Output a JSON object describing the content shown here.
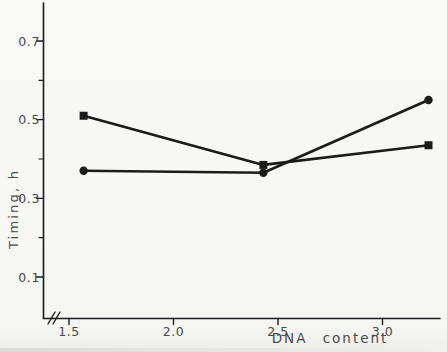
{
  "figure": {
    "background": "#f7f7f4",
    "ink": "#1b1b1b",
    "label_color": "#4a4a48"
  },
  "chart_data": {
    "type": "line",
    "title": "",
    "xlabel": "DNA content",
    "ylabel": "Timing, h",
    "xlim": [
      1.38,
      3.28
    ],
    "ylim": [
      0,
      0.8
    ],
    "x_axis_break_near_origin": true,
    "grid": false,
    "legend": null,
    "x_ticks_major": [
      1.5,
      2.0,
      2.5,
      3.0
    ],
    "x_tick_labels": [
      "1.5",
      "2.0",
      "2.5",
      "3.0"
    ],
    "y_ticks_major": [
      0.1,
      0.3,
      0.5,
      0.7
    ],
    "y_tick_labels": [
      "0.1",
      "0.3",
      "0.5",
      "0.7"
    ],
    "y_ticks_minor": [
      0.2,
      0.4,
      0.6
    ],
    "series": [
      {
        "name": "square-markers",
        "marker": "square",
        "color": "#1b1b1b",
        "x": [
          1.57,
          2.43,
          3.22
        ],
        "y": [
          0.51,
          0.385,
          0.435
        ]
      },
      {
        "name": "circle-markers",
        "marker": "circle",
        "color": "#1b1b1b",
        "x": [
          1.57,
          2.43,
          3.22
        ],
        "y": [
          0.37,
          0.365,
          0.55
        ]
      }
    ]
  }
}
